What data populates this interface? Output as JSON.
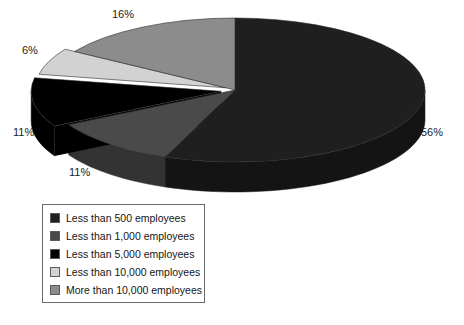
{
  "chart_data": {
    "type": "pie",
    "title": "",
    "subtitle": "",
    "xlabel": "",
    "ylabel": "",
    "three_d": true,
    "legend_position": "bottom-left",
    "grid": false,
    "categories": [
      "Less than 500 employees",
      "Less than 1,000 employees",
      "Less than 5,000 employees",
      "Less than 10,000 employees",
      "More than 10,000 employees"
    ],
    "values": [
      56,
      11,
      11,
      6,
      16
    ],
    "data_labels": [
      "56%",
      "11%",
      "11%",
      "6%",
      "16%"
    ],
    "colors": [
      "#1f1f1f",
      "#4a4a4a",
      "#000000",
      "#d2d2d2",
      "#8c8c8c"
    ],
    "side_colors": [
      "#141414",
      "#333333",
      "#000000",
      "#a8a8a8",
      "#6e6e6e"
    ],
    "slices": [
      {
        "label": "Less than 500 employees",
        "value": 56,
        "display": "56%",
        "color": "#1f1f1f",
        "side_color": "#141414"
      },
      {
        "label": "Less than 1,000 employees",
        "value": 11,
        "display": "11%",
        "color": "#4a4a4a",
        "side_color": "#333333"
      },
      {
        "label": "Less than 5,000 employees",
        "value": 11,
        "display": "11%",
        "color": "#000000",
        "side_color": "#000000"
      },
      {
        "label": "Less than 10,000 employees",
        "value": 6,
        "display": "6%",
        "color": "#d2d2d2",
        "side_color": "#a8a8a8"
      },
      {
        "label": "More than 10,000 employees",
        "value": 16,
        "display": "16%",
        "color": "#8c8c8c",
        "side_color": "#6e6e6e"
      }
    ]
  },
  "pie": {
    "labels": [
      {
        "text": "16%"
      },
      {
        "text": "6%"
      },
      {
        "text": "11%"
      },
      {
        "text": "11%"
      },
      {
        "text": "56%"
      }
    ]
  },
  "legend": {
    "items": [
      {
        "label": "Less than 500 employees",
        "color": "#1f1f1f"
      },
      {
        "label": "Less than 1,000 employees",
        "color": "#4a4a4a"
      },
      {
        "label": "Less than 5,000 employees",
        "color": "#000000"
      },
      {
        "label": "Less than 10,000 employees",
        "color": "#d2d2d2"
      },
      {
        "label": "More than 10,000 employees",
        "color": "#8c8c8c"
      }
    ]
  },
  "colors": {
    "background": "#ffffff",
    "text": "#151515",
    "legend_border": "#6b6b6b"
  }
}
